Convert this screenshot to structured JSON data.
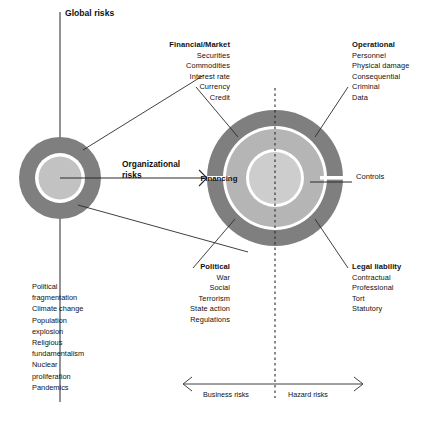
{
  "diagram": {
    "title": "Global risks",
    "center_label": "Financing",
    "organizational_label": "Organizational risks",
    "controls_label": "Controls",
    "colors": {
      "outer_ring": "#7f7f7f",
      "middle_ring": "#b3b3b3",
      "inner_disc": "#c9c9c9",
      "separator": "#ffffff",
      "line": "#2a2a2a",
      "text": "#111111"
    }
  },
  "groups": {
    "financial": {
      "heading": "Financial/Market",
      "items": [
        "Securities",
        "Commodities",
        "Interest rate",
        "Currency",
        "Credit"
      ]
    },
    "operational": {
      "heading": "Operational",
      "items": [
        "Personnel",
        "Physical damage",
        "Consequential",
        "Criminal",
        "Data"
      ]
    },
    "political": {
      "heading": "Political",
      "items": [
        "War",
        "Social",
        "Terrorism",
        "State action",
        "Regulations"
      ]
    },
    "legal": {
      "heading": "Legal liability",
      "items": [
        "Contractual",
        "Professional",
        "Tort",
        "Statutory"
      ]
    }
  },
  "global_risks": {
    "items": [
      "Political",
      "fragmentation",
      "Climate change",
      "Population",
      "explosion",
      "Religious",
      "fundamentalism",
      "Nuclear",
      "proliferation",
      "Pandemics"
    ]
  },
  "axis": {
    "left_label": "Business risks",
    "right_label": "Hazard risks"
  }
}
